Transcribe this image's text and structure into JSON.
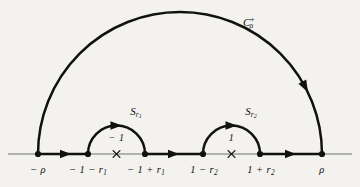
{
  "figure": {
    "name": "contour-integration-diagram",
    "background_color": "#f3f2ee",
    "curve_color": "#111111",
    "axis_color": "#6e6e6e",
    "axis": {
      "y": 154,
      "x_start": 8,
      "x_end": 352,
      "direction_arrow_positions": [
        66,
        174,
        291
      ]
    },
    "outer_arc": {
      "label": "C",
      "label_sub": "ρ",
      "label_sup": "+",
      "center_x": 180,
      "center_y": 154,
      "radius": 142,
      "label_x": 248,
      "label_y": 16,
      "arrow_angle_deg": 28
    },
    "indent_arcs": [
      {
        "label": "S",
        "label_sub": "r",
        "label_subsub": "1",
        "center_x": 116.5,
        "center_y": 154,
        "radius": 28.5,
        "label_x": 136,
        "label_y": 106
      },
      {
        "label": "S",
        "label_sub": "r",
        "label_subsub": "2",
        "center_x": 231.5,
        "center_y": 154,
        "radius": 28.5,
        "label_x": 251,
        "label_y": 106
      }
    ],
    "poles": [
      {
        "marker": "×",
        "label": "− 1",
        "x": 116.5,
        "label_y": 133
      },
      {
        "marker": "×",
        "label": "1",
        "x": 231.5,
        "label_y": 133
      }
    ],
    "axis_points": [
      {
        "x": 38,
        "label": "− ρ",
        "sub": "",
        "label_x": 38
      },
      {
        "x": 88,
        "label": "− 1 − r",
        "sub": "1",
        "label_x": 88
      },
      {
        "x": 145,
        "label": "− 1 + r",
        "sub": "1",
        "label_x": 146
      },
      {
        "x": 203,
        "label": "1 − r",
        "sub": "2",
        "label_x": 204
      },
      {
        "x": 260,
        "label": "1 + r",
        "sub": "2",
        "label_x": 261
      },
      {
        "x": 322,
        "label": "ρ",
        "sub": "",
        "label_x": 322
      }
    ],
    "axis_label_y": 165
  }
}
